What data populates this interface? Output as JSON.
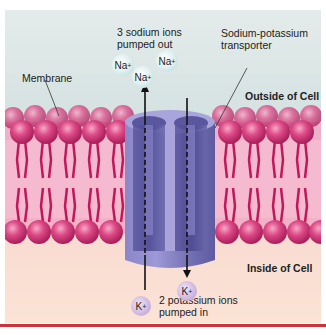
{
  "diagram": {
    "labels": {
      "sodium_out": [
        "3 sodium ions",
        "pumped out"
      ],
      "transporter": [
        "Sodium-potassium",
        "transporter"
      ],
      "membrane": "Membrane",
      "outside": "Outside of Cell",
      "inside": "Inside of Cell",
      "potassium_in": [
        "2 potassium ions",
        "pumped in"
      ]
    },
    "ions": {
      "sodium": [
        {
          "symbol": "Na",
          "charge": "+"
        },
        {
          "symbol": "Na",
          "charge": "+"
        },
        {
          "symbol": "Na",
          "charge": "+"
        }
      ],
      "potassium": [
        {
          "symbol": "K",
          "charge": "+"
        },
        {
          "symbol": "K",
          "charge": "+"
        }
      ]
    },
    "colors": {
      "outside_bg": "#d6e3e2",
      "inside_bg": "#fbe3d6",
      "phospholipid_head": "#d8437f",
      "phospholipid_tail": "#c2185b",
      "transporter": "#7f7bbf",
      "sodium_ion": "#cfe6e6",
      "potassium_ion": "#c6aedc",
      "rule": "#c8343d"
    }
  }
}
